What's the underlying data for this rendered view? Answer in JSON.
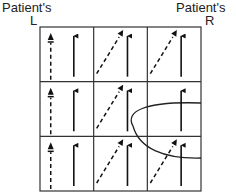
{
  "labels": {
    "left_top": "Patient's",
    "left_letter": "L",
    "right_top": "Patient's",
    "right_letter": "R"
  },
  "grid": {
    "rows": 3,
    "cols": 3,
    "x0": 40,
    "y0": 27,
    "x1": 201,
    "y1": 191,
    "line_color": "#333333"
  },
  "cells": [
    {
      "row": 0,
      "col": 0,
      "solid_arrow": "up",
      "dashed_arrow": "up"
    },
    {
      "row": 0,
      "col": 1,
      "solid_arrow": "up",
      "dashed_arrow": "diagonal-up-right"
    },
    {
      "row": 0,
      "col": 2,
      "solid_arrow": "up",
      "dashed_arrow": "diagonal-up-right"
    },
    {
      "row": 1,
      "col": 0,
      "solid_arrow": "up",
      "dashed_arrow": "up"
    },
    {
      "row": 1,
      "col": 1,
      "solid_arrow": "up",
      "dashed_arrow": "diagonal-up-right"
    },
    {
      "row": 1,
      "col": 2,
      "solid_arrow": "up",
      "dashed_arrow": "none"
    },
    {
      "row": 2,
      "col": 0,
      "solid_arrow": "up",
      "dashed_arrow": "up"
    },
    {
      "row": 2,
      "col": 1,
      "solid_arrow": "up",
      "dashed_arrow": "diagonal-up-right"
    },
    {
      "row": 2,
      "col": 2,
      "solid_arrow": "up",
      "dashed_arrow": "diagonal-up-right"
    }
  ],
  "lesion_curve": {
    "description": "curved boundary entering from right edge",
    "start": [
      201,
      103
    ],
    "apex": [
      133,
      126
    ],
    "end": [
      201,
      158
    ]
  }
}
